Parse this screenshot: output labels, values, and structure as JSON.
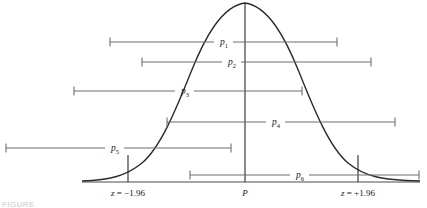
{
  "figure": {
    "caption_fragment": "FIGURE",
    "colors": {
      "curve": "#2b2b2b",
      "interval": "#6f6f6f",
      "axis": "#4a4a4a",
      "text": "#1a1a1a",
      "background": "#ffffff"
    }
  },
  "chart_data": {
    "type": "line",
    "title": "",
    "xlabel": "",
    "ylabel": "",
    "grid": false,
    "legend_position": "none",
    "curve": {
      "name": "normal-distribution",
      "description": "bell-shaped normal sampling distribution of p",
      "peak_x": 245,
      "peak_y": 3,
      "baseline_y": 182,
      "left_end_x": 82,
      "right_end_x": 420
    },
    "axis": {
      "baseline_label": "",
      "ticks": [
        {
          "name": "z-lower",
          "label": "z = −1.96",
          "x": 128,
          "value": -1.96
        },
        {
          "name": "center",
          "label": "P",
          "x": 245,
          "value": 0
        },
        {
          "name": "z-upper",
          "label": "z = +1.96",
          "x": 358,
          "value": 1.96
        }
      ]
    },
    "intervals": [
      {
        "label": "p",
        "subscript": "1",
        "x_start": 110,
        "x_end": 337,
        "y": 42,
        "contains_p": true
      },
      {
        "label": "p",
        "subscript": "2",
        "x_start": 142,
        "x_end": 371,
        "y": 62,
        "contains_p": true
      },
      {
        "label": "p",
        "subscript": "3",
        "x_start": 74,
        "x_end": 302,
        "y": 91,
        "contains_p": true
      },
      {
        "label": "p",
        "subscript": "4",
        "x_start": 167,
        "x_end": 395,
        "y": 122,
        "contains_p": true
      },
      {
        "label": "p",
        "subscript": "5",
        "x_start": 6,
        "x_end": 231,
        "y": 148,
        "contains_p": false
      },
      {
        "label": "p",
        "subscript": "6",
        "x_start": 190,
        "x_end": 419,
        "y": 175,
        "contains_p": true
      }
    ],
    "interval_label_x": [
      224,
      232,
      185,
      276,
      115,
      300
    ]
  }
}
